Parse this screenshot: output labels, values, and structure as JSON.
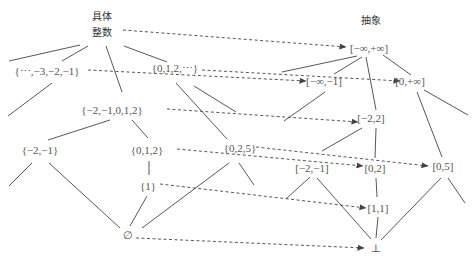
{
  "headers": {
    "concrete_line1": "具体",
    "concrete_line2": "整数",
    "abstract": "抽象"
  },
  "concrete_nodes": {
    "negatives": "{⋯,−3,−2,−1}",
    "naturals": "{0,1,2,⋯}",
    "range_m2_2": "{−2,−1,0,1,2}",
    "m2_m1": "{−2,−1}",
    "set_012": "{0,1,2}",
    "set_025": "{0,2,5}",
    "singleton_1": "{1}",
    "empty": "∅"
  },
  "abstract_nodes": {
    "top": "[−∞,+∞]",
    "neg_inf_m1": "[−∞,−1]",
    "zero_inf": "[0,+∞]",
    "m2_2": "[−2,2]",
    "m2_m1": "[−2,−1]",
    "zero_2": "[0,2]",
    "zero_5": "[0,5]",
    "one_one": "[1,1]",
    "bottom": "⊥"
  },
  "colors": {
    "line": "#444444",
    "text": "#555555"
  }
}
